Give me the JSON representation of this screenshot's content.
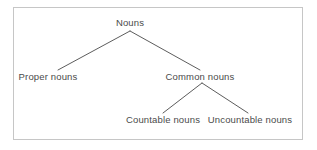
{
  "figure": {
    "kind": "tree-diagram",
    "colors": {
      "text": "#4a4a4a",
      "line": "#4a4a4a",
      "frame": "#c6c6c6",
      "background": "#ffffff"
    }
  },
  "tree": {
    "root": {
      "id": "nouns",
      "label": "Nouns"
    },
    "level1": [
      {
        "id": "proper-nouns",
        "label": "Proper nouns"
      },
      {
        "id": "common-nouns",
        "label": "Common nouns"
      }
    ],
    "level2": [
      {
        "id": "countable-nouns",
        "label": "Countable nouns"
      },
      {
        "id": "uncountable-nouns",
        "label": "Uncountable nouns"
      }
    ]
  },
  "edges": [
    {
      "from": "nouns",
      "to": "proper-nouns",
      "x1": 130,
      "y1": 31,
      "x2": 58,
      "y2": 70
    },
    {
      "from": "nouns",
      "to": "common-nouns",
      "x1": 130,
      "y1": 31,
      "x2": 200,
      "y2": 70
    },
    {
      "from": "common-nouns",
      "to": "countable-nouns",
      "x1": 202,
      "y1": 83,
      "x2": 163,
      "y2": 113
    },
    {
      "from": "common-nouns",
      "to": "uncountable-nouns",
      "x1": 202,
      "y1": 83,
      "x2": 248,
      "y2": 113
    }
  ]
}
